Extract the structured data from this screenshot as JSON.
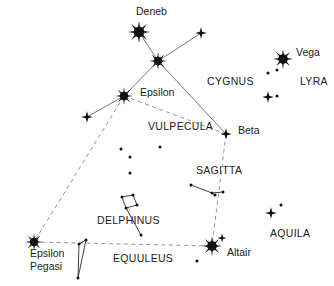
{
  "chart_data": {
    "type": "scatter",
    "title": "",
    "subtitle": "",
    "xlabel": "",
    "ylabel": "",
    "grid": false,
    "legend": "none",
    "xlim": [
      0,
      334
    ],
    "ylim": [
      0,
      286
    ],
    "star_labels": [
      {
        "name": "Deneb",
        "x": 136,
        "y": 15
      },
      {
        "name": "Vega",
        "x": 296,
        "y": 56
      },
      {
        "name": "Epsilon",
        "x": 140,
        "y": 96
      },
      {
        "name": "Beta",
        "x": 238,
        "y": 134
      },
      {
        "name": "Altair",
        "x": 227,
        "y": 256
      },
      {
        "name": "Epsilon",
        "x": 30,
        "y": 257
      },
      {
        "name": "Pegasi",
        "x": 30,
        "y": 270
      }
    ],
    "constellation_labels": [
      {
        "name": "CYGNUS",
        "x": 207,
        "y": 85
      },
      {
        "name": "LYRA",
        "x": 300,
        "y": 85
      },
      {
        "name": "VULPECULA",
        "x": 148,
        "y": 130
      },
      {
        "name": "SAGITTA",
        "x": 196,
        "y": 174
      },
      {
        "name": "AQUILA",
        "x": 270,
        "y": 237
      },
      {
        "name": "DELPHINUS",
        "x": 97,
        "y": 224
      },
      {
        "name": "EQUULEUS",
        "x": 113,
        "y": 262
      }
    ],
    "stars": [
      {
        "label": "Deneb",
        "x": 139,
        "y": 32,
        "magnitude": "bright",
        "size": 9
      },
      {
        "label": "Sadr",
        "x": 158,
        "y": 61,
        "magnitude": "bright",
        "size": 7
      },
      {
        "label": "Cygnus wing east",
        "x": 201,
        "y": 33,
        "magnitude": "medium",
        "size": 5
      },
      {
        "label": "Epsilon Cygni",
        "x": 124,
        "y": 96,
        "magnitude": "bright",
        "size": 7
      },
      {
        "label": "Cygnus wing west",
        "x": 87,
        "y": 117,
        "magnitude": "medium",
        "size": 5
      },
      {
        "label": "Beta Cygni (Albireo)",
        "x": 226,
        "y": 134,
        "magnitude": "medium",
        "size": 5
      },
      {
        "label": "Vega",
        "x": 283,
        "y": 59,
        "magnitude": "bright",
        "size": 8
      },
      {
        "label": "Lyra epsilon",
        "x": 268,
        "y": 97,
        "magnitude": "medium",
        "size": 5
      },
      {
        "label": "Lyra faint a",
        "x": 268,
        "y": 73,
        "magnitude": "faint",
        "size": 2
      },
      {
        "label": "Lyra faint b",
        "x": 277,
        "y": 70,
        "magnitude": "faint",
        "size": 2
      },
      {
        "label": "Lyra faint c",
        "x": 277,
        "y": 96,
        "magnitude": "faint",
        "size": 2
      },
      {
        "label": "Altair",
        "x": 212,
        "y": 246,
        "magnitude": "bright",
        "size": 8
      },
      {
        "label": "Tarazed",
        "x": 222,
        "y": 238,
        "magnitude": "medium",
        "size": 4
      },
      {
        "label": "Alshain",
        "x": 197,
        "y": 261,
        "magnitude": "faint",
        "size": 2
      },
      {
        "label": "Aquila star",
        "x": 271,
        "y": 213,
        "magnitude": "medium",
        "size": 5
      },
      {
        "label": "Aquila faint",
        "x": 281,
        "y": 205,
        "magnitude": "faint",
        "size": 2
      },
      {
        "label": "Sagitta a",
        "x": 191,
        "y": 185,
        "magnitude": "faint",
        "size": 2
      },
      {
        "label": "Sagitta b",
        "x": 212,
        "y": 193,
        "magnitude": "faint",
        "size": 2
      },
      {
        "label": "Sagitta c",
        "x": 215,
        "y": 195,
        "magnitude": "faint",
        "size": 2
      },
      {
        "label": "Sagitta d",
        "x": 223,
        "y": 192,
        "magnitude": "faint",
        "size": 2
      },
      {
        "label": "Delphinus a",
        "x": 122,
        "y": 197,
        "magnitude": "faint",
        "size": 2
      },
      {
        "label": "Delphinus b",
        "x": 133,
        "y": 195,
        "magnitude": "faint",
        "size": 2
      },
      {
        "label": "Delphinus c",
        "x": 137,
        "y": 205,
        "magnitude": "faint",
        "size": 2
      },
      {
        "label": "Delphinus d",
        "x": 126,
        "y": 208,
        "magnitude": "faint",
        "size": 2
      },
      {
        "label": "Delphinus tail",
        "x": 141,
        "y": 235,
        "magnitude": "faint",
        "size": 2
      },
      {
        "label": "Epsilon Pegasi",
        "x": 34,
        "y": 242,
        "magnitude": "bright",
        "size": 7
      },
      {
        "label": "Equuleus a",
        "x": 86,
        "y": 240,
        "magnitude": "faint",
        "size": 2
      },
      {
        "label": "Equuleus b",
        "x": 79,
        "y": 244,
        "magnitude": "faint",
        "size": 2
      },
      {
        "label": "Equuleus c",
        "x": 78,
        "y": 278,
        "magnitude": "faint",
        "size": 2
      },
      {
        "label": "Vulpecula faint a",
        "x": 121,
        "y": 149,
        "magnitude": "faint",
        "size": 2
      },
      {
        "label": "Vulpecula faint b",
        "x": 130,
        "y": 157,
        "magnitude": "faint",
        "size": 2
      },
      {
        "label": "Vulpecula faint c",
        "x": 160,
        "y": 147,
        "magnitude": "faint",
        "size": 2
      },
      {
        "label": "Vulpecula faint d",
        "x": 130,
        "y": 173,
        "magnitude": "faint",
        "size": 2
      }
    ],
    "solid_lines": [
      {
        "from": "Deneb",
        "to": "Sadr",
        "x1": 139,
        "y1": 32,
        "x2": 158,
        "y2": 61
      },
      {
        "from": "Sadr",
        "to": "Cygnus wing east",
        "x1": 158,
        "y1": 61,
        "x2": 201,
        "y2": 33
      },
      {
        "from": "Sadr",
        "to": "Epsilon Cygni",
        "x1": 158,
        "y1": 61,
        "x2": 124,
        "y2": 96
      },
      {
        "from": "Sadr",
        "to": "Beta Cygni",
        "x1": 158,
        "y1": 61,
        "x2": 226,
        "y2": 134
      },
      {
        "from": "Epsilon Cygni",
        "to": "Cygnus wing west",
        "x1": 124,
        "y1": 96,
        "x2": 87,
        "y2": 117
      }
    ],
    "dashed_lines": [
      {
        "from": "Epsilon Cygni",
        "to": "Beta Cygni",
        "x1": 124,
        "y1": 96,
        "x2": 226,
        "y2": 134
      },
      {
        "from": "Epsilon Cygni",
        "to": "Epsilon Pegasi",
        "x1": 124,
        "y1": 96,
        "x2": 34,
        "y2": 242
      },
      {
        "from": "Beta Cygni",
        "to": "Altair",
        "x1": 226,
        "y1": 134,
        "x2": 212,
        "y2": 246
      },
      {
        "from": "Epsilon Pegasi",
        "to": "Altair",
        "x1": 34,
        "y1": 242,
        "x2": 212,
        "y2": 246
      }
    ],
    "asterism_lines": [
      {
        "group": "Sagitta",
        "x1": 191,
        "y1": 185,
        "x2": 212,
        "y2": 193
      },
      {
        "group": "Sagitta",
        "x1": 212,
        "y1": 193,
        "x2": 223,
        "y2": 192
      },
      {
        "group": "Sagitta",
        "x1": 212,
        "y1": 193,
        "x2": 215,
        "y2": 195
      },
      {
        "group": "Delphinus",
        "x1": 122,
        "y1": 197,
        "x2": 133,
        "y2": 195
      },
      {
        "group": "Delphinus",
        "x1": 133,
        "y1": 195,
        "x2": 137,
        "y2": 205
      },
      {
        "group": "Delphinus",
        "x1": 137,
        "y1": 205,
        "x2": 126,
        "y2": 208
      },
      {
        "group": "Delphinus",
        "x1": 126,
        "y1": 208,
        "x2": 122,
        "y2": 197
      },
      {
        "group": "Delphinus",
        "x1": 126,
        "y1": 208,
        "x2": 141,
        "y2": 235
      },
      {
        "group": "Equuleus",
        "x1": 86,
        "y1": 240,
        "x2": 79,
        "y2": 244
      },
      {
        "group": "Equuleus",
        "x1": 79,
        "y1": 244,
        "x2": 78,
        "y2": 278
      },
      {
        "group": "Equuleus",
        "x1": 86,
        "y1": 240,
        "x2": 78,
        "y2": 278
      }
    ]
  },
  "colors": {
    "star": "#111111",
    "line": "#666666",
    "dash": "#888888",
    "text": "#1a1a1a",
    "background": "#ffffff"
  }
}
